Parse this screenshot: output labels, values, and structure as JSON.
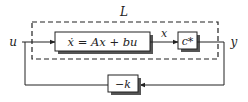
{
  "diagram": {
    "type": "block-diagram",
    "outer_label": "L",
    "input_label": "u",
    "output_label": "y",
    "state_label": "x",
    "blocks": [
      {
        "id": "plant",
        "text": "ẋ = Ax + bu",
        "shadow": true
      },
      {
        "id": "output-map",
        "text": "c*",
        "shadow": true
      },
      {
        "id": "feedback-gain",
        "text": "−k",
        "shadow": true
      }
    ],
    "connections": [
      {
        "from": "u",
        "to": "plant",
        "label": ""
      },
      {
        "from": "plant",
        "to": "output-map",
        "label": "x"
      },
      {
        "from": "output-map",
        "to": "y",
        "label": ""
      },
      {
        "from": "y",
        "to": "feedback-gain",
        "label": ""
      },
      {
        "from": "feedback-gain",
        "to": "u",
        "label": ""
      }
    ],
    "colors": {
      "line": "#222222",
      "shadow": "#555555",
      "background": "#ffffff"
    }
  }
}
